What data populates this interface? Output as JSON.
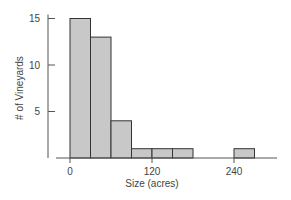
{
  "chart_data": {
    "type": "bar",
    "subtype": "histogram",
    "title": "",
    "xlabel": "Size (acres)",
    "ylabel": "# of Vineyards",
    "bin_width": 30,
    "bins": [
      {
        "start": 0,
        "end": 30,
        "count": 15
      },
      {
        "start": 30,
        "end": 60,
        "count": 13
      },
      {
        "start": 60,
        "end": 90,
        "count": 4
      },
      {
        "start": 90,
        "end": 120,
        "count": 1
      },
      {
        "start": 120,
        "end": 150,
        "count": 1
      },
      {
        "start": 150,
        "end": 180,
        "count": 1
      },
      {
        "start": 180,
        "end": 210,
        "count": 0
      },
      {
        "start": 210,
        "end": 240,
        "count": 0
      },
      {
        "start": 240,
        "end": 270,
        "count": 1
      }
    ],
    "categories": [
      "0-30",
      "30-60",
      "60-90",
      "90-120",
      "120-150",
      "150-180",
      "180-210",
      "210-240",
      "240-270"
    ],
    "values": [
      15,
      13,
      4,
      1,
      1,
      1,
      0,
      0,
      1
    ],
    "x_ticks": [
      0,
      120,
      240
    ],
    "y_ticks": [
      5,
      10,
      15
    ],
    "xlim": [
      0,
      270
    ],
    "ylim": [
      0,
      15
    ],
    "grid": false,
    "legend": null,
    "colors": {
      "bar_fill": "#c8c8c8",
      "bar_edge": "#333333",
      "axis": "#555555"
    }
  }
}
